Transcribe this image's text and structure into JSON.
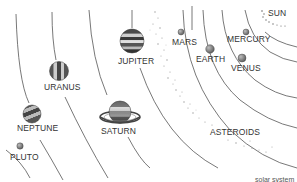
{
  "diagram": {
    "caption": "solar system",
    "colors": {
      "orbit_line": "#555555",
      "label_text": "#333333",
      "planet_gray": "#8a8a8a",
      "band_dark": "#3a3a3a",
      "band_light": "#cfcfcf",
      "asteroid_dots": "#999999"
    },
    "bodies": [
      {
        "id": "sun",
        "label": "SUN"
      },
      {
        "id": "mercury",
        "label": "MERCURY"
      },
      {
        "id": "venus",
        "label": "VENUS"
      },
      {
        "id": "earth",
        "label": "EARTH"
      },
      {
        "id": "mars",
        "label": "MARS"
      },
      {
        "id": "asteroids",
        "label": "ASTEROIDS"
      },
      {
        "id": "jupiter",
        "label": "JUPITER"
      },
      {
        "id": "saturn",
        "label": "SATURN"
      },
      {
        "id": "uranus",
        "label": "URANUS"
      },
      {
        "id": "neptune",
        "label": "NEPTUNE"
      },
      {
        "id": "pluto",
        "label": "PLUTO"
      }
    ]
  }
}
